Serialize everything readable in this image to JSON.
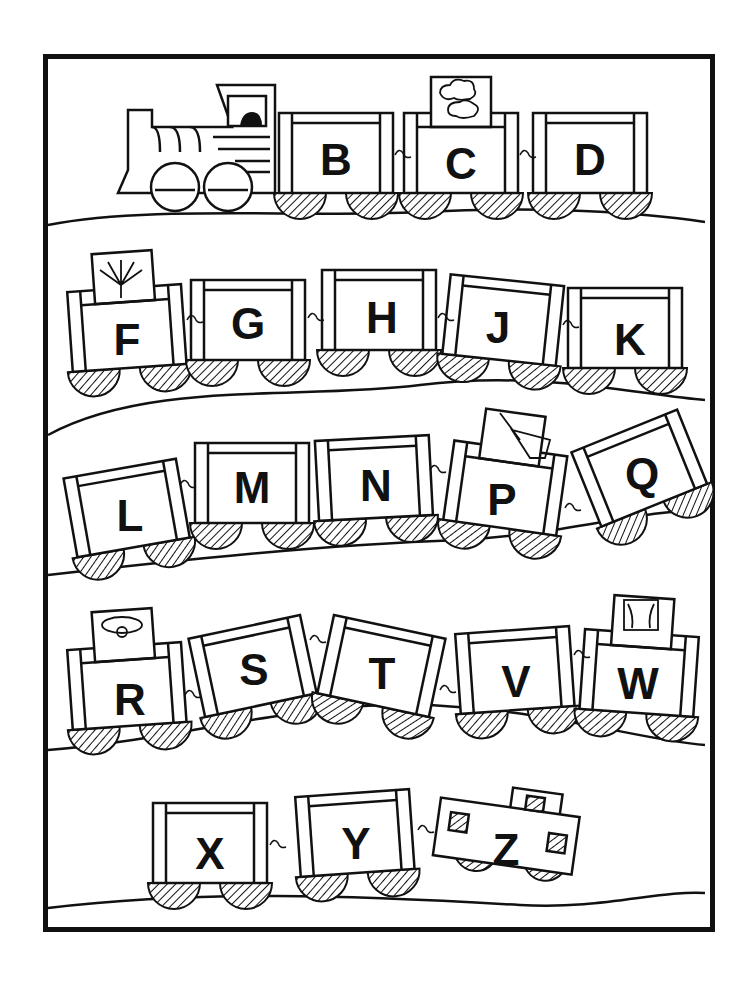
{
  "worksheet": {
    "title": "",
    "theme": "alphabet train - missing vowels",
    "colors": {
      "ink": "#111111",
      "paper": "#ffffff"
    }
  },
  "rows": [
    {
      "cars": [
        {
          "type": "engine",
          "letter": ""
        },
        {
          "type": "car",
          "letter": "B"
        },
        {
          "type": "car",
          "letter": "C",
          "picture": "cloud"
        },
        {
          "type": "car",
          "letter": "D"
        }
      ]
    },
    {
      "cars": [
        {
          "type": "car",
          "letter": "F",
          "picture": "fan"
        },
        {
          "type": "car",
          "letter": "G"
        },
        {
          "type": "car",
          "letter": "H"
        },
        {
          "type": "car",
          "letter": "J"
        },
        {
          "type": "car",
          "letter": "K"
        }
      ]
    },
    {
      "cars": [
        {
          "type": "car",
          "letter": "L"
        },
        {
          "type": "car",
          "letter": "M"
        },
        {
          "type": "car",
          "letter": "N"
        },
        {
          "type": "car",
          "letter": "P",
          "picture": "pail"
        },
        {
          "type": "car",
          "letter": "Q"
        }
      ]
    },
    {
      "cars": [
        {
          "type": "car",
          "letter": "R",
          "picture": "ring"
        },
        {
          "type": "car",
          "letter": "S"
        },
        {
          "type": "car",
          "letter": "T"
        },
        {
          "type": "car",
          "letter": "V"
        },
        {
          "type": "car",
          "letter": "W",
          "picture": "window"
        }
      ]
    },
    {
      "cars": [
        {
          "type": "car",
          "letter": "X"
        },
        {
          "type": "car",
          "letter": "Y"
        },
        {
          "type": "caboose",
          "letter": "Z"
        }
      ]
    }
  ]
}
